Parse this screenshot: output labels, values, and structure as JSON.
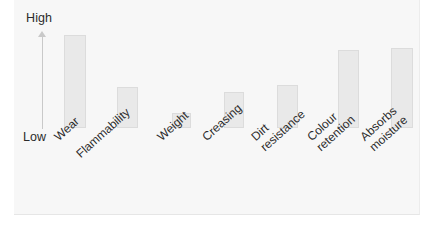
{
  "chart_data": {
    "type": "bar",
    "title": "",
    "subtitle": "",
    "xlabel": "",
    "ylabel": "",
    "ylim": [
      0,
      100
    ],
    "grid": false,
    "legend": null,
    "axis_top_label": "High",
    "axis_bottom_label": "Low",
    "categories": [
      "Wear",
      "Flammability",
      "Weight",
      "Creasing",
      "Dirt\nresistance",
      "Colour\nretention",
      "Absorbs\nmoisture"
    ],
    "values": [
      97,
      43,
      16,
      38,
      45,
      81,
      83
    ],
    "bar_color": "#e9e9e9",
    "bar_border_color": "#dcdcdc",
    "axis_color": "#c9c9c9",
    "background_color": "#f7f7f7",
    "text_color": "#2b2b2b"
  },
  "bars": [
    {
      "label": "Wear",
      "value": 97,
      "x": 64,
      "w": 22,
      "top": 35,
      "h": 93
    },
    {
      "label": "Flammability",
      "value": 43,
      "x": 117,
      "w": 21,
      "top": 87,
      "h": 41
    },
    {
      "label": "Weight",
      "value": 16,
      "x": 172,
      "w": 19,
      "top": 113,
      "h": 15
    },
    {
      "label": "Creasing",
      "value": 38,
      "x": 224,
      "w": 20,
      "top": 92,
      "h": 36
    },
    {
      "label": "Dirt\nresistance",
      "value": 45,
      "x": 277,
      "w": 21,
      "top": 85,
      "h": 43
    },
    {
      "label": "Colour\nretention",
      "value": 81,
      "x": 338,
      "w": 21,
      "top": 50,
      "h": 78
    },
    {
      "label": "Absorbs\nmoisture",
      "value": 83,
      "x": 391,
      "w": 22,
      "top": 48,
      "h": 80
    }
  ],
  "labels": [
    {
      "text": "Wear",
      "x": 52,
      "y": 134
    },
    {
      "text": "Flammability",
      "x": 74,
      "y": 151
    },
    {
      "text": "Weight",
      "x": 155,
      "y": 134
    },
    {
      "text": "Creasing",
      "x": 200,
      "y": 134
    },
    {
      "text": "Dirt\nresistance",
      "x": 249,
      "y": 134
    },
    {
      "text": "Colour\nretention",
      "x": 305,
      "y": 134
    },
    {
      "text": "Absorbs\nmoisture",
      "x": 358,
      "y": 134
    }
  ]
}
